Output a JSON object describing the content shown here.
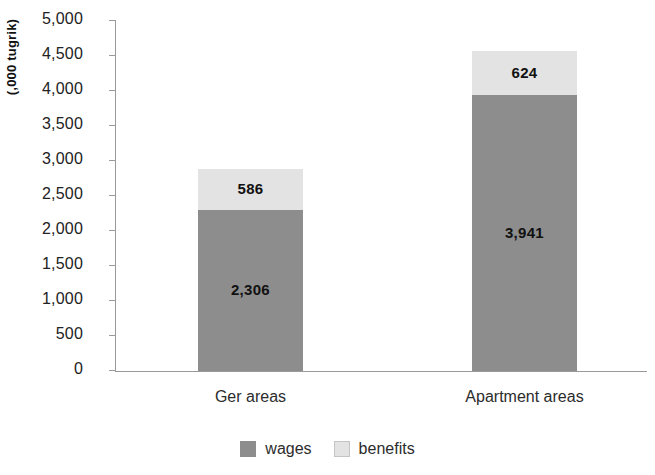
{
  "chart_data": {
    "type": "bar",
    "stacked": true,
    "title": "",
    "subtitle": "",
    "xlabel": "",
    "ylabel": "(,000 tugrik)",
    "categories": [
      "Ger areas",
      "Apartment areas"
    ],
    "series": [
      {
        "name": "wages",
        "values": [
          2306,
          3941
        ],
        "color": "#8d8d8d",
        "labels": [
          "2,306",
          "3,941"
        ]
      },
      {
        "name": "benefits",
        "values": [
          586,
          624
        ],
        "color": "#e3e3e3",
        "labels": [
          "586",
          "624"
        ]
      }
    ],
    "totals": [
      2892,
      4565
    ],
    "ylim": [
      0,
      5000
    ],
    "ytick_step": 500,
    "ytick_labels": [
      "5,000",
      "4,500",
      "4,000",
      "3,500",
      "3,000",
      "2,500",
      "2,000",
      "1,500",
      "1,000",
      "500",
      "0"
    ],
    "ytick_values": [
      5000,
      4500,
      4000,
      3500,
      3000,
      2500,
      2000,
      1500,
      1000,
      500,
      0
    ],
    "grid": false,
    "legend_position": "bottom",
    "legend_entries": [
      "wages",
      "benefits"
    ]
  },
  "axis": {
    "y_title": "(,000 tugrik)"
  },
  "colors": {
    "wages": "#8d8d8d",
    "benefits": "#e3e3e3",
    "axis": "#9a9a9a",
    "text": "#222222",
    "background": "#ffffff"
  }
}
